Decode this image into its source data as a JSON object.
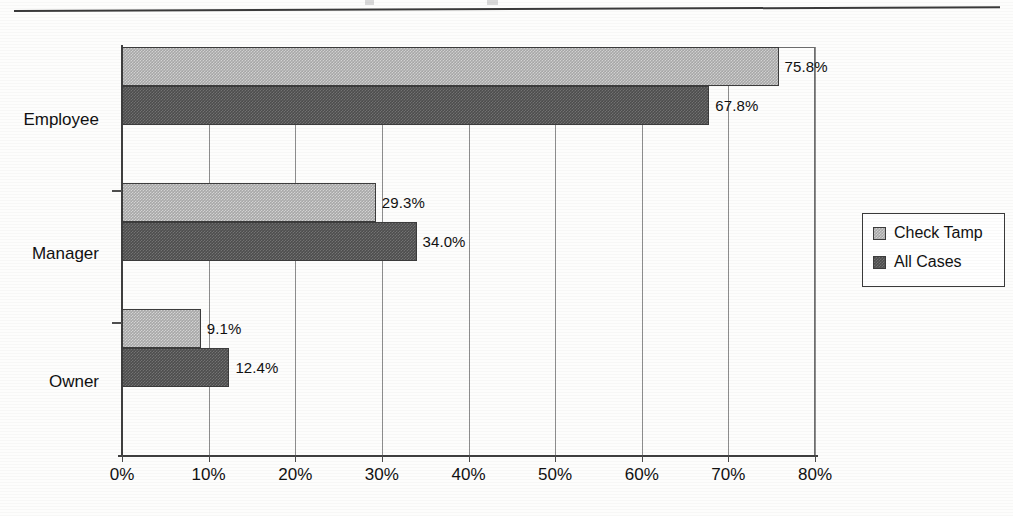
{
  "page": {
    "has_top_rule": true,
    "background_color": "#fdfdfc"
  },
  "chart_data": {
    "type": "bar",
    "orientation": "horizontal",
    "title": "",
    "xlabel": "",
    "ylabel": "",
    "categories": [
      "Employee",
      "Manager",
      "Owner"
    ],
    "series": [
      {
        "name": "Check Tamp",
        "color": "#a9a9a9",
        "values": [
          75.8,
          29.3,
          9.1
        ],
        "value_labels": [
          "75.8%",
          "67.8%-pair"
        ]
      },
      {
        "name": "All Cases",
        "color": "#4e4e4e",
        "values": [
          67.8,
          34.0,
          12.4
        ]
      }
    ],
    "bars": [
      {
        "category": "Employee",
        "series": "Check Tamp",
        "value": 75.8,
        "label": "75.8%"
      },
      {
        "category": "Employee",
        "series": "All Cases",
        "value": 67.8,
        "label": "67.8%"
      },
      {
        "category": "Manager",
        "series": "Check Tamp",
        "value": 29.3,
        "label": "29.3%"
      },
      {
        "category": "Manager",
        "series": "All Cases",
        "value": 34.0,
        "label": "34.0%"
      },
      {
        "category": "Owner",
        "series": "Check Tamp",
        "value": 9.1,
        "label": "9.1%"
      },
      {
        "category": "Owner",
        "series": "All Cases",
        "value": 12.4,
        "label": "12.4%"
      }
    ],
    "xlim": [
      0,
      80
    ],
    "xticks": [
      0,
      10,
      20,
      30,
      40,
      50,
      60,
      70,
      80
    ],
    "xtick_labels": [
      "0%",
      "10%",
      "20%",
      "30%",
      "40%",
      "50%",
      "60%",
      "70%",
      "80%"
    ],
    "grid": "vertical",
    "legend": {
      "position": "right",
      "entries": [
        {
          "label": "Check Tamp",
          "color": "#a9a9a9"
        },
        {
          "label": "All Cases",
          "color": "#4e4e4e"
        }
      ]
    }
  }
}
